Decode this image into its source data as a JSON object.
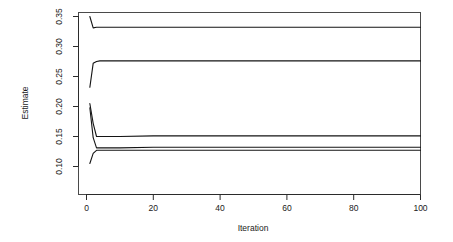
{
  "chart_data": {
    "type": "line",
    "title": "",
    "subtitle": "",
    "xlabel": "Iteration",
    "ylabel": "Estimate",
    "xlim": [
      0,
      100
    ],
    "ylim": [
      0.1,
      0.35
    ],
    "xticks": [
      0,
      20,
      40,
      60,
      80,
      100
    ],
    "xticklabels": [
      "0",
      "20",
      "40",
      "60",
      "80",
      "100"
    ],
    "yticks": [
      0.1,
      0.15,
      0.2,
      0.25,
      0.3,
      0.35
    ],
    "yticklabels": [
      "0.10",
      "0.15",
      "0.20",
      "0.25",
      "0.30",
      "0.35"
    ],
    "grid": false,
    "legend": "none",
    "box": true,
    "line_color": "#141414",
    "axis_color": "#2b2b2b",
    "background": "#ffffff",
    "x": [
      1,
      2,
      3,
      4,
      5,
      10,
      20,
      40,
      60,
      80,
      100
    ],
    "series": [
      {
        "name": "chain-1",
        "values": [
          0.35,
          0.331,
          0.332,
          0.332,
          0.332,
          0.332,
          0.332,
          0.332,
          0.332,
          0.332,
          0.332
        ]
      },
      {
        "name": "chain-2",
        "values": [
          0.232,
          0.272,
          0.275,
          0.276,
          0.276,
          0.276,
          0.276,
          0.276,
          0.276,
          0.276,
          0.276
        ]
      },
      {
        "name": "chain-3",
        "values": [
          0.205,
          0.172,
          0.15,
          0.15,
          0.15,
          0.15,
          0.151,
          0.151,
          0.151,
          0.151,
          0.151
        ]
      },
      {
        "name": "chain-4",
        "values": [
          0.198,
          0.148,
          0.131,
          0.131,
          0.131,
          0.131,
          0.132,
          0.132,
          0.132,
          0.132,
          0.132
        ]
      },
      {
        "name": "chain-5",
        "values": [
          0.105,
          0.122,
          0.127,
          0.127,
          0.127,
          0.127,
          0.127,
          0.127,
          0.127,
          0.127,
          0.127
        ]
      }
    ]
  },
  "axes": {
    "x_title": "Iteration",
    "y_title": "Estimate",
    "x_tick_0": "0",
    "x_tick_1": "20",
    "x_tick_2": "40",
    "x_tick_3": "60",
    "x_tick_4": "80",
    "x_tick_5": "100",
    "y_tick_0": "0.10",
    "y_tick_1": "0.15",
    "y_tick_2": "0.20",
    "y_tick_3": "0.25",
    "y_tick_4": "0.30",
    "y_tick_5": "0.35"
  }
}
